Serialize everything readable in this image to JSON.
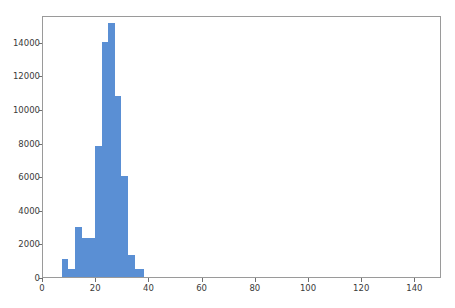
{
  "figure": {
    "background_color": "#ffffff",
    "bar_color": "#5a8fd4",
    "axis_color": "#9a9a9a",
    "tick_color": "#6f6f6f"
  },
  "chart_data": {
    "type": "bar",
    "title": "",
    "subtitle": "",
    "xlabel": "",
    "ylabel": "",
    "xlim": [
      0,
      150
    ],
    "ylim": [
      0,
      15600
    ],
    "grid": false,
    "legend": null,
    "xticks": [
      0,
      20,
      40,
      60,
      80,
      100,
      120,
      140
    ],
    "xtick_labels": [
      "0",
      "20",
      "40",
      "60",
      "80",
      "100",
      "120",
      "140"
    ],
    "yticks": [
      0,
      2000,
      4000,
      6000,
      8000,
      10000,
      12000,
      14000
    ],
    "ytick_labels": [
      "0",
      "2000",
      "4000",
      "6000",
      "8000",
      "10000",
      "12000",
      "14000"
    ],
    "bin_edges": [
      7.0,
      9.5,
      12.0,
      14.5,
      17.0,
      19.5,
      22.0,
      24.5,
      27.0,
      29.5,
      32.0,
      34.5,
      38.0
    ],
    "categories": [
      "7.0-9.5",
      "9.5-12.0",
      "12.0-14.5",
      "14.5-17.0",
      "17.0-19.5",
      "19.5-22.0",
      "22.0-24.5",
      "24.5-27.0",
      "27.0-29.5",
      "29.5-32.0",
      "32.0-34.5",
      "34.5-38.0"
    ],
    "values": [
      1050,
      500,
      3000,
      2300,
      2300,
      7800,
      14000,
      15100,
      10800,
      6000,
      1300,
      500
    ]
  }
}
